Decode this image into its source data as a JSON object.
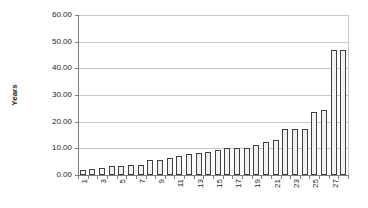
{
  "chart_data": {
    "type": "bar",
    "title": "",
    "xlabel": "",
    "ylabel": "Years",
    "ylim": [
      0,
      60
    ],
    "grid": "horizontal",
    "legend": "none",
    "ytick_values": [
      0,
      10,
      20,
      30,
      40,
      50,
      60
    ],
    "ytick_labels": [
      "0.00",
      "10.00",
      "20.00",
      "30.00",
      "40.00",
      "50.00",
      "60.00"
    ],
    "categories": [
      1,
      2,
      3,
      4,
      5,
      6,
      7,
      8,
      9,
      10,
      11,
      12,
      13,
      14,
      15,
      16,
      17,
      18,
      19,
      20,
      21,
      22,
      23,
      24,
      25,
      26,
      27,
      28
    ],
    "xtick_labels_shown": [
      "1",
      "3",
      "5",
      "7",
      "9",
      "11",
      "13",
      "15",
      "17",
      "19",
      "21",
      "23",
      "25",
      "27"
    ],
    "values": [
      2.0,
      2.1,
      2.7,
      3.2,
      3.5,
      3.7,
      3.8,
      5.5,
      5.8,
      6.3,
      7.2,
      7.7,
      8.3,
      8.7,
      9.5,
      10.0,
      10.0,
      10.3,
      11.3,
      12.5,
      13.0,
      17.2,
      17.4,
      17.4,
      23.6,
      24.5,
      46.9,
      46.9
    ],
    "colors": {
      "bar_fill": "#f2f2f2",
      "bar_border": "#404040",
      "gridline": "#c9c9c9",
      "axis": "#7f7f7f",
      "text": "#262626",
      "background": "#ffffff"
    }
  }
}
